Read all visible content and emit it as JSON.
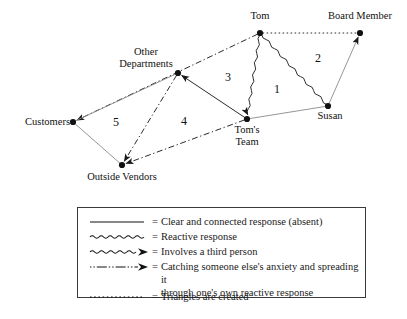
{
  "diagram": {
    "nodes": [
      {
        "id": "tom",
        "label": "Tom",
        "x": 260,
        "y": 33,
        "label_x": 260,
        "label_y": 10,
        "align": "center"
      },
      {
        "id": "board_member",
        "label": "Board Member",
        "x": 360,
        "y": 33,
        "label_x": 360,
        "label_y": 10,
        "align": "center"
      },
      {
        "id": "other_departments",
        "label": "Other\nDepartments",
        "x": 178,
        "y": 73,
        "label_x": 146,
        "label_y": 46,
        "align": "center"
      },
      {
        "id": "customers",
        "label": "Customers",
        "x": 73,
        "y": 122,
        "label_x": 36,
        "label_y": 116,
        "align": "right"
      },
      {
        "id": "outside_vendors",
        "label": "Outside Vendors",
        "x": 122,
        "y": 165,
        "label_x": 122,
        "label_y": 171,
        "align": "center"
      },
      {
        "id": "toms_team",
        "label": "Tom's\nTeam",
        "x": 247,
        "y": 119,
        "label_x": 247,
        "label_y": 124,
        "align": "center"
      },
      {
        "id": "susan",
        "label": "Susan",
        "x": 328,
        "y": 106,
        "label_x": 330,
        "label_y": 110,
        "align": "center"
      }
    ],
    "region_numbers": [
      {
        "value": "5",
        "x": 113,
        "y": 115
      },
      {
        "value": "4",
        "x": 181,
        "y": 114
      },
      {
        "value": "3",
        "x": 225,
        "y": 70
      },
      {
        "value": "1",
        "x": 274,
        "y": 82
      },
      {
        "value": "2",
        "x": 315,
        "y": 51
      }
    ],
    "edges": [
      {
        "id": "tom-board-member",
        "from": "tom",
        "to": "board_member",
        "style": "dotted",
        "arrow": "none",
        "meaning": "triangles-are-created"
      },
      {
        "id": "tom-toms-team",
        "from": "tom",
        "to": "toms_team",
        "style": "wavy",
        "arrow": "end",
        "meaning": "involves-a-third-person"
      },
      {
        "id": "tom-susan",
        "from": "tom",
        "to": "susan",
        "style": "wavy",
        "arrow": "none",
        "meaning": "reactive-response"
      },
      {
        "id": "susan-board-member",
        "from": "susan",
        "to": "board_member",
        "style": "solid-thin",
        "arrow": "end",
        "meaning": "clear-and-connected-response"
      },
      {
        "id": "susan-toms-team",
        "from": "susan",
        "to": "toms_team",
        "style": "solid-thin",
        "arrow": "none",
        "meaning": "clear-and-connected-response"
      },
      {
        "id": "tom-other-departments-customers",
        "from": "tom",
        "to": "customers",
        "style": "dash-dot",
        "arrow": "end",
        "meaning": "catching-anxiety-spreading"
      },
      {
        "id": "other-departments-outside-vendors",
        "from": "other_departments",
        "to": "outside_vendors",
        "style": "dash-dot",
        "arrow": "end",
        "meaning": "catching-anxiety-spreading"
      },
      {
        "id": "toms-team-outside-vendors",
        "from": "toms_team",
        "to": "outside_vendors",
        "style": "dash-dot",
        "arrow": "end",
        "meaning": "catching-anxiety-spreading"
      },
      {
        "id": "toms-team-other-departments",
        "from": "toms_team",
        "to": "other_departments",
        "style": "solid",
        "arrow": "end",
        "meaning": "clear-and-connected-response"
      },
      {
        "id": "customers-outside-vendors",
        "from": "customers",
        "to": "outside_vendors",
        "style": "solid-thin",
        "arrow": "none",
        "meaning": "clear-and-connected-response"
      },
      {
        "id": "other-departments-customers-thin",
        "from": "other_departments",
        "to": "customers",
        "style": "solid-thin",
        "arrow": "none",
        "meaning": "clear-and-connected-response"
      }
    ]
  },
  "legend": {
    "equals": "=",
    "items": [
      {
        "symbol": "solid",
        "text": "Clear and connected response (absent)"
      },
      {
        "symbol": "wavy",
        "text": "Reactive response"
      },
      {
        "symbol": "wavy-arrow",
        "text": "Involves a third person"
      },
      {
        "symbol": "dash-dot-arrow",
        "text": "Catching someone else's anxiety and spreading it\nthrough one's own reactive response"
      },
      {
        "symbol": "dotted",
        "text": "Triangles are created"
      }
    ]
  },
  "colors": {
    "ink": "#111111",
    "line": "#2b2b2b",
    "thin_line": "#8a8a8a",
    "legend_border": "#3a3a3a",
    "background": "#ffffff"
  }
}
